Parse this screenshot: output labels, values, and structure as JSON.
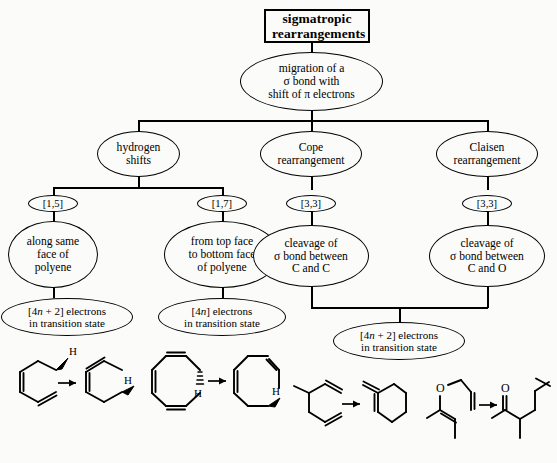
{
  "diagram": {
    "title_node": {
      "label": "sigmatropic rearrangements",
      "line1": "sigmatropic",
      "line2": "rearrangements"
    },
    "definition_node": {
      "line1": "migration of a",
      "line2": "σ bond with",
      "line3": "shift of π electrons"
    },
    "branches": [
      {
        "name": "hydrogen-shifts",
        "line1": "hydrogen",
        "line2": "shifts",
        "shift_labels": [
          "[1,5]",
          "[1,7]"
        ],
        "children": [
          {
            "name": "suprafacial",
            "line1": "along same",
            "line2": "face of",
            "line3": "polyene",
            "electrons": {
              "prefix": "[4",
              "italic": "n",
              "suffix": " + 2] electrons",
              "line2": "in transition state"
            }
          },
          {
            "name": "antarafacial",
            "line1": "from top face",
            "line2": "to bottom face",
            "line3": "of polyene",
            "electrons": {
              "prefix": "[4",
              "italic": "n",
              "suffix": "] electrons",
              "line2": "in transition state"
            }
          }
        ]
      },
      {
        "name": "cope-rearrangement",
        "line1": "Cope",
        "line2": "rearrangement",
        "shift_label": "[3,3]",
        "cleavage": {
          "line1": "cleavage of",
          "line2": "σ bond between",
          "line3": "C and C"
        }
      },
      {
        "name": "claisen-rearrangement",
        "line1": "Claisen",
        "line2": "rearrangement",
        "shift_label": "[3,3]",
        "cleavage": {
          "line1": "cleavage of",
          "line2": "σ bond between",
          "line3": "C and O"
        }
      }
    ],
    "shared_electrons_node": {
      "prefix": "[4",
      "italic": "n",
      "suffix": " + 2] electrons",
      "line2": "in transition state"
    }
  },
  "chem_schemes": [
    {
      "name": "hydrogen-shift-1-5",
      "reactant_label": "H",
      "product_label": "H",
      "arrow": "→",
      "description": "1,3-pentadiene [1,5] hydrogen shift, suprafacial"
    },
    {
      "name": "hydrogen-shift-1-7",
      "reactant_label": "H",
      "product_label": "H",
      "arrow": "→",
      "description": "cycloheptatriene [1,7] hydrogen shift, antarafacial"
    },
    {
      "name": "cope-scheme",
      "arrow": "→",
      "description": "1,5-hexadiene Cope rearrangement"
    },
    {
      "name": "claisen-scheme",
      "arrow": "→",
      "oxygen_label": "O",
      "carbonyl_label": "O",
      "description": "allyl vinyl ether Claisen rearrangement to unsaturated ketone"
    }
  ],
  "colors": {
    "ink": "#000000",
    "page": "#fbfbf9"
  }
}
